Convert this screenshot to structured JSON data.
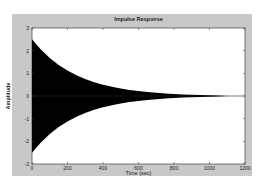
{
  "chart_data": {
    "type": "line",
    "title": "Impulse Response",
    "xlabel": "Time (sec)",
    "ylabel": "Amplitude",
    "xlim": [
      0,
      1200
    ],
    "ylim": [
      -3,
      3
    ],
    "xticks": [
      0,
      200,
      400,
      600,
      800,
      1000,
      1200
    ],
    "yticks": [
      3,
      2,
      1,
      0,
      -1,
      -2,
      -3
    ],
    "grid": false,
    "legend": null,
    "series": [
      {
        "name": "Impulse Response",
        "description": "Dense oscillation with exponentially decaying envelope",
        "envelope_x": [
          0,
          50,
          100,
          150,
          200,
          250,
          300,
          350,
          400,
          450,
          500,
          550,
          600,
          650,
          700,
          750,
          800,
          850,
          900,
          950,
          1000,
          1050,
          1100,
          1150,
          1200
        ],
        "envelope_upper": [
          2.5,
          2.05,
          1.68,
          1.37,
          1.12,
          0.92,
          0.75,
          0.61,
          0.5,
          0.41,
          0.33,
          0.27,
          0.22,
          0.18,
          0.14,
          0.11,
          0.09,
          0.07,
          0.05,
          0.04,
          0.03,
          0.02,
          0.0,
          0.0,
          0.0
        ],
        "envelope_lower": [
          -2.5,
          -2.05,
          -1.68,
          -1.37,
          -1.12,
          -0.92,
          -0.75,
          -0.61,
          -0.5,
          -0.41,
          -0.33,
          -0.27,
          -0.22,
          -0.18,
          -0.14,
          -0.11,
          -0.09,
          -0.07,
          -0.05,
          -0.04,
          -0.03,
          -0.02,
          0.0,
          0.0,
          0.0
        ]
      }
    ]
  },
  "figure": {
    "background_color": "#c8c8c8",
    "axes_color": "#ffffff",
    "line_color": "#000000"
  }
}
